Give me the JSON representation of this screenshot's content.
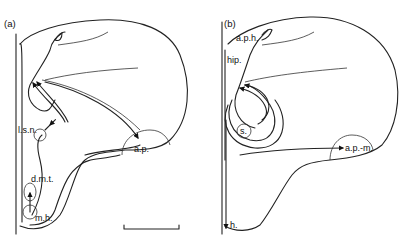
{
  "panels": [
    {
      "id": "a",
      "label": "(a)",
      "structures": [
        {
          "key": "lsn",
          "label": "l.s.n."
        },
        {
          "key": "ap",
          "label": "a.p."
        },
        {
          "key": "dmt",
          "label": "d.m.t."
        },
        {
          "key": "mh",
          "label": "m.h."
        }
      ],
      "scale_bar": true
    },
    {
      "id": "b",
      "label": "(b)",
      "structures": [
        {
          "key": "aph",
          "label": "a.p.h."
        },
        {
          "key": "hip",
          "label": "hip."
        },
        {
          "key": "s",
          "label": "s."
        },
        {
          "key": "apm",
          "label": "a.p.-m."
        },
        {
          "key": "h",
          "label": "h."
        }
      ],
      "scale_bar": false
    }
  ],
  "colors": {
    "line": "#222222",
    "background": "#ffffff"
  }
}
